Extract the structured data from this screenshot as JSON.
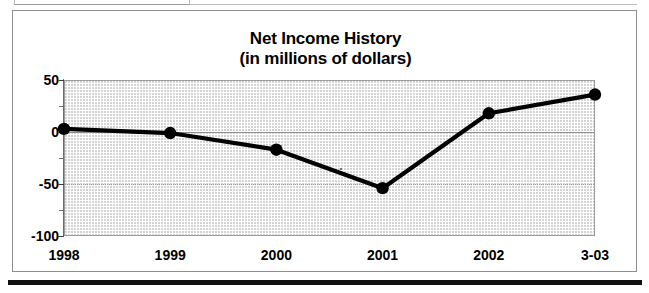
{
  "figure": {
    "bottom_rule": "",
    "frame_label": "net-income-history-figure"
  },
  "chart_data": {
    "type": "line",
    "title": "Net Income History",
    "subtitle": "(in millions of dollars)",
    "xlabel": "",
    "ylabel": "",
    "categories": [
      "1998",
      "1999",
      "2000",
      "2001",
      "2002",
      "3-03"
    ],
    "values": [
      3,
      -1,
      -17,
      -54,
      18,
      36
    ],
    "series": [
      {
        "name": "Net Income",
        "values": [
          3,
          -1,
          -17,
          -54,
          18,
          36
        ]
      }
    ],
    "ylim": [
      -100,
      50
    ],
    "yticks": [
      50,
      0,
      -50,
      -100
    ],
    "ytick_labels": [
      "50",
      "0",
      "-50",
      "-100"
    ],
    "yminor_ticks": [
      25,
      -25,
      -75
    ],
    "grid": true,
    "gridlines": [
      0,
      -50
    ],
    "legend": "none",
    "marker": "filled-circle",
    "line_color": "#000000",
    "plot_background": "#ffffff",
    "plot_pattern": "light-dotted-stipple",
    "grid_color": "#9c9c9c",
    "units": "millions of dollars"
  }
}
